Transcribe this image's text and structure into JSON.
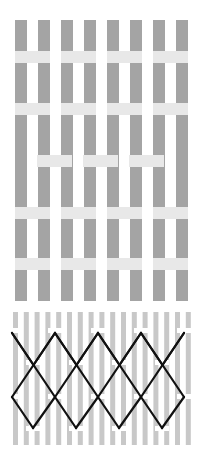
{
  "colors": {
    "background": "#ffffff",
    "bar_dark": "#a4a4a4",
    "band_light": "#e8e8e8",
    "bar_thin": "#c8c8c8",
    "line": "#111111",
    "tab": "#ffffff"
  },
  "top_grid": {
    "bar_count": 8,
    "bar_x": [
      15,
      38,
      61,
      84,
      107,
      130,
      153,
      176
    ],
    "bar_width": 12,
    "y_start": 20,
    "y_end": 301,
    "bands": [
      {
        "y": 51,
        "height": 12,
        "segments": [
          [
            15,
            50
          ],
          [
            61,
            96
          ],
          [
            107,
            142
          ],
          [
            153,
            188
          ]
        ]
      },
      {
        "y": 103,
        "height": 12,
        "segments": [
          [
            15,
            50
          ],
          [
            61,
            96
          ],
          [
            107,
            142
          ],
          [
            153,
            188
          ]
        ]
      },
      {
        "y": 155,
        "height": 12,
        "segments": [
          [
            37,
            72
          ],
          [
            83,
            118
          ],
          [
            129,
            164
          ]
        ]
      },
      {
        "y": 207,
        "height": 12,
        "segments": [
          [
            15,
            50
          ],
          [
            61,
            96
          ],
          [
            107,
            142
          ],
          [
            153,
            188
          ]
        ]
      },
      {
        "y": 258,
        "height": 12,
        "segments": [
          [
            15,
            50
          ],
          [
            61,
            96
          ],
          [
            107,
            142
          ],
          [
            153,
            188
          ]
        ]
      }
    ]
  },
  "bottom_grid": {
    "bar_count": 17,
    "bar_x_start": 13,
    "bar_spacing": 10.8,
    "bar_width": 5,
    "y_start": 312,
    "y_end": 445,
    "zigzag_lines": [
      {
        "name": "upper",
        "points": [
          [
            12,
            333
          ],
          [
            33,
            365
          ],
          [
            55,
            333
          ],
          [
            76,
            365
          ],
          [
            98,
            333
          ],
          [
            119,
            365
          ],
          [
            141,
            333
          ],
          [
            162,
            365
          ],
          [
            184,
            333
          ]
        ]
      },
      {
        "name": "diamond-top",
        "points": [
          [
            12,
            397
          ],
          [
            55,
            333
          ],
          [
            98,
            397
          ],
          [
            141,
            333
          ],
          [
            184,
            397
          ]
        ]
      },
      {
        "name": "lattice",
        "points": []
      }
    ],
    "peaks_y": 333,
    "mid_y": 397,
    "valleys_y": 428,
    "peak_x": [
      12,
      55,
      98,
      141,
      184
    ],
    "valley_x": [
      33,
      76,
      119,
      162
    ],
    "mid_x": [
      12,
      55,
      98,
      141,
      184
    ],
    "cross_y": 365
  }
}
